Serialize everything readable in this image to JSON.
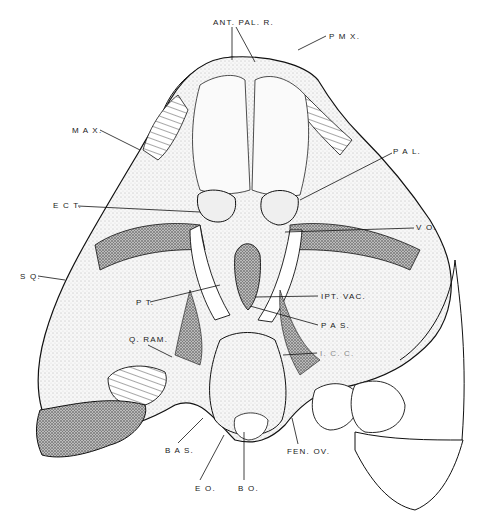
{
  "figure": {
    "labels": [
      {
        "id": "ant-pal-r",
        "text": "ANT. PAL. R.",
        "x": 213,
        "y": 19
      },
      {
        "id": "pmx",
        "text": "P M X.",
        "x": 329,
        "y": 33
      },
      {
        "id": "max",
        "text": "M A X.",
        "x": 72,
        "y": 127
      },
      {
        "id": "pal",
        "text": "P A L.",
        "x": 393,
        "y": 148
      },
      {
        "id": "ect",
        "text": "E C T.",
        "x": 53,
        "y": 202
      },
      {
        "id": "vo",
        "text": "V O.",
        "x": 416,
        "y": 224
      },
      {
        "id": "sq",
        "text": "S Q.",
        "x": 20,
        "y": 273
      },
      {
        "id": "pt",
        "text": "P T.",
        "x": 136,
        "y": 299
      },
      {
        "id": "ipt-vac",
        "text": "IPT. VAC.",
        "x": 321,
        "y": 293
      },
      {
        "id": "pas",
        "text": "P A S.",
        "x": 321,
        "y": 322
      },
      {
        "id": "icc",
        "text": "I. C. C.",
        "x": 320,
        "y": 350,
        "faint": true
      },
      {
        "id": "q-ram",
        "text": "Q. RAM.",
        "x": 129,
        "y": 336
      },
      {
        "id": "bas",
        "text": "B A S.",
        "x": 165,
        "y": 447
      },
      {
        "id": "fen-ov",
        "text": "FEN. OV.",
        "x": 287,
        "y": 448
      },
      {
        "id": "eo",
        "text": "E O.",
        "x": 195,
        "y": 485
      },
      {
        "id": "bo",
        "text": "B O.",
        "x": 238,
        "y": 485
      }
    ]
  }
}
